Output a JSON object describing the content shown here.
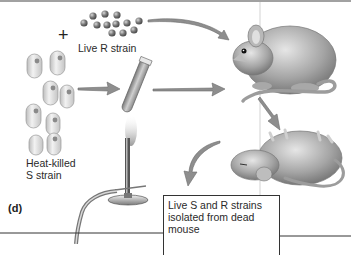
{
  "figure": {
    "panel_label": "(d)",
    "plus_sign": "+",
    "labels": {
      "live_r_strain": "Live R strain",
      "heat_killed_line1": "Heat-killed",
      "heat_killed_line2": "S strain"
    },
    "caption_box": {
      "lines": [
        "Live S and R strains",
        "isolated from dead",
        "mouse"
      ]
    },
    "elements": [
      {
        "name": "live-r-strain-bacteria",
        "description": "cluster of small gray round cells"
      },
      {
        "name": "heat-killed-s-strain-bacteria",
        "description": "capsule-shaped cells"
      },
      {
        "name": "test-tube",
        "description": "tube held over flame"
      },
      {
        "name": "bunsen-burner",
        "description": "burner with flame and hose"
      },
      {
        "name": "live-mouse",
        "description": "mouse injected with mixture"
      },
      {
        "name": "dead-mouse",
        "description": "mouse lying on its back"
      },
      {
        "name": "arrows",
        "description": "gray process arrows"
      }
    ],
    "colors": {
      "arrow": "#8a8a8a",
      "cell_dark": "#6b6b6b",
      "capsule": "#d9d9d9",
      "mouse": "#9a9a9a",
      "line": "#333333"
    }
  }
}
